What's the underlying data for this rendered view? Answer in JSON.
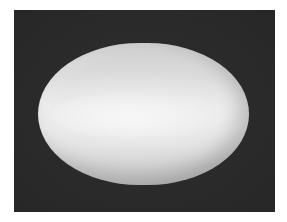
{
  "image": {
    "subject": "rendered 3D ellipsoid / superquadric shape",
    "background_color": "#2b2b2b",
    "page_color": "#ffffff",
    "shape_color": "#dcdcdc",
    "highlight_color": "#efefef",
    "shadow_color": "#c4c4c4"
  }
}
